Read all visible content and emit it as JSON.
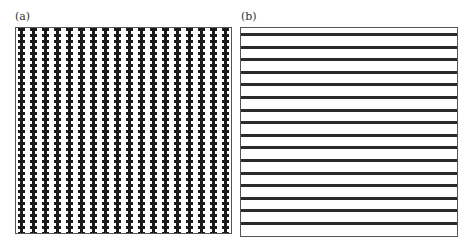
{
  "panels": [
    {
      "label": "(a)",
      "pattern": "vertical-wavy-stripes",
      "stripe_count": 18,
      "stripe_color": "#1a1a1a"
    },
    {
      "label": "(b)",
      "pattern": "horizontal-stripes",
      "stripe_count": 16,
      "stripe_color": "#2a2a2a"
    }
  ]
}
